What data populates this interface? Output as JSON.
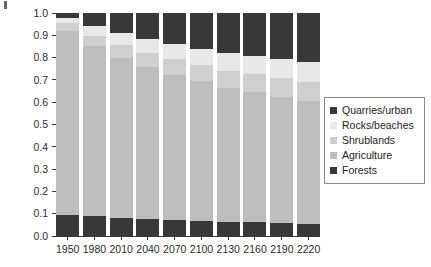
{
  "chart_data": {
    "type": "bar",
    "stacked": true,
    "title": "",
    "xlabel": "",
    "ylabel": "",
    "ylim": [
      0.0,
      1.0
    ],
    "grid": false,
    "legend_position": "right",
    "categories": [
      "1950",
      "1980",
      "2010",
      "2040",
      "2070",
      "2100",
      "2130",
      "2160",
      "2190",
      "2220"
    ],
    "ytick_labels": [
      "1.0",
      "0.9",
      "0.8",
      "0.7",
      "0.6",
      "0.5",
      "0.4",
      "0.3",
      "0.2",
      "0.1",
      "0.0"
    ],
    "ytick_values": [
      1.0,
      0.9,
      0.8,
      0.7,
      0.6,
      0.5,
      0.4,
      0.3,
      0.2,
      0.1,
      0.0
    ],
    "stack_order_bottom_to_top": [
      "Forests",
      "Agriculture",
      "Shrublands",
      "Rocks/beaches",
      "Quarries/urban"
    ],
    "series": [
      {
        "name": "Forests",
        "color": "#383838",
        "values": [
          0.095,
          0.088,
          0.082,
          0.076,
          0.072,
          0.068,
          0.064,
          0.062,
          0.059,
          0.056
        ]
      },
      {
        "name": "Agriculture",
        "color": "#bdbdbd",
        "values": [
          0.825,
          0.762,
          0.718,
          0.681,
          0.651,
          0.625,
          0.601,
          0.583,
          0.566,
          0.551
        ]
      },
      {
        "name": "Shrublands",
        "color": "#cfcfcf",
        "values": [
          0.035,
          0.047,
          0.056,
          0.063,
          0.069,
          0.073,
          0.077,
          0.08,
          0.082,
          0.085
        ]
      },
      {
        "name": "Rocks/beaches",
        "color": "#e8e8e8",
        "values": [
          0.025,
          0.043,
          0.054,
          0.062,
          0.068,
          0.074,
          0.078,
          0.082,
          0.086,
          0.09
        ]
      },
      {
        "name": "Quarries/urban",
        "color": "#383838",
        "values": [
          0.02,
          0.06,
          0.09,
          0.118,
          0.14,
          0.16,
          0.18,
          0.193,
          0.207,
          0.218
        ]
      }
    ]
  },
  "legend": {
    "items": [
      {
        "label": "Quarries/urban",
        "color": "#383838"
      },
      {
        "label": "Rocks/beaches",
        "color": "#e8e8e8"
      },
      {
        "label": "Shrublands",
        "color": "#cfcfcf"
      },
      {
        "label": "Agriculture",
        "color": "#bdbdbd"
      },
      {
        "label": "Forests",
        "color": "#383838"
      }
    ]
  }
}
